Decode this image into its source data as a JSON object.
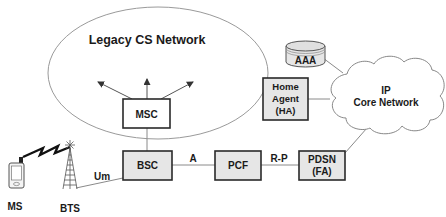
{
  "diagram": {
    "type": "network-architecture",
    "colors": {
      "box_fill_shaded": "#e6e6e6",
      "box_fill_white": "#ffffff",
      "box_stroke": "#2a2a2a",
      "link_stroke": "#8a8a8a",
      "ellipse_stroke": "#9a9a9a",
      "text": "#1a1a1a"
    },
    "regions": {
      "legacy_cs_network": {
        "label": "Legacy CS Network"
      },
      "ip_core_network": {
        "label_line1": "IP",
        "label_line2": "Core Network"
      }
    },
    "nodes": {
      "msc": {
        "label": "MSC"
      },
      "bsc": {
        "label": "BSC"
      },
      "pcf": {
        "label": "PCF"
      },
      "pdsn": {
        "label_line1": "PDSN",
        "label_line2": "(FA)"
      },
      "home_agent": {
        "label_line1": "Home",
        "label_line2": "Agent",
        "label_line3": "(HA)"
      },
      "aaa": {
        "label": "AAA"
      },
      "ms": {
        "label": "MS"
      },
      "bts": {
        "label": "BTS"
      }
    },
    "interfaces": {
      "um": "Um",
      "a": "A",
      "r_p": "R-P"
    }
  }
}
